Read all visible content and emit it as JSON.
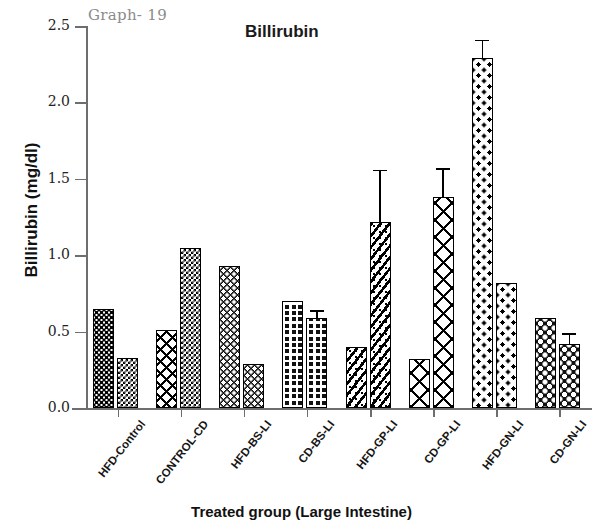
{
  "annotations": {
    "graph_number": "Graph- 19"
  },
  "chart_data": {
    "type": "bar",
    "title": "Billirubin",
    "xlabel": "Treated group (Large Intestine)",
    "ylabel": "Billirubin (mg/dl)",
    "ylim": [
      0.0,
      2.5
    ],
    "ytick_labels": [
      "0.0",
      "0.5",
      "1.0",
      "1.5",
      "2.0",
      "2.5"
    ],
    "ytick_values": [
      0.0,
      0.5,
      1.0,
      1.5,
      2.0,
      2.5
    ],
    "grid": false,
    "legend": "none",
    "categories": [
      "HFD-Control",
      "CONTROL-CD",
      "HFD-BS-LI",
      "CD-BS-LI",
      "HFD-GP-LI",
      "CD-GP-LI",
      "HFD-GN-LI",
      "CD-GN-LI"
    ],
    "series": [
      {
        "name": "bar-1",
        "values": [
          0.65,
          0.51,
          0.93,
          0.7,
          0.4,
          0.32,
          2.29,
          0.59
        ],
        "errors": [
          0.0,
          0.0,
          0.0,
          0.0,
          0.0,
          0.0,
          0.11,
          0.0
        ]
      },
      {
        "name": "bar-2",
        "values": [
          0.33,
          1.05,
          0.29,
          0.59,
          1.22,
          1.38,
          0.82,
          0.42
        ],
        "errors": [
          0.0,
          0.0,
          0.0,
          0.04,
          0.33,
          0.18,
          0.0,
          0.06
        ]
      }
    ],
    "bar_patterns": [
      [
        "dot-med",
        "checker"
      ],
      [
        "xcross",
        "checker"
      ],
      [
        "dot-white",
        "dot-white"
      ],
      [
        "grid",
        "grid"
      ],
      [
        "diag-dot",
        "diag-dot"
      ],
      [
        "xcross-open",
        "xcross-open"
      ],
      [
        "sparse-dot",
        "sparse-dot"
      ],
      [
        "blob",
        "blob"
      ]
    ]
  }
}
